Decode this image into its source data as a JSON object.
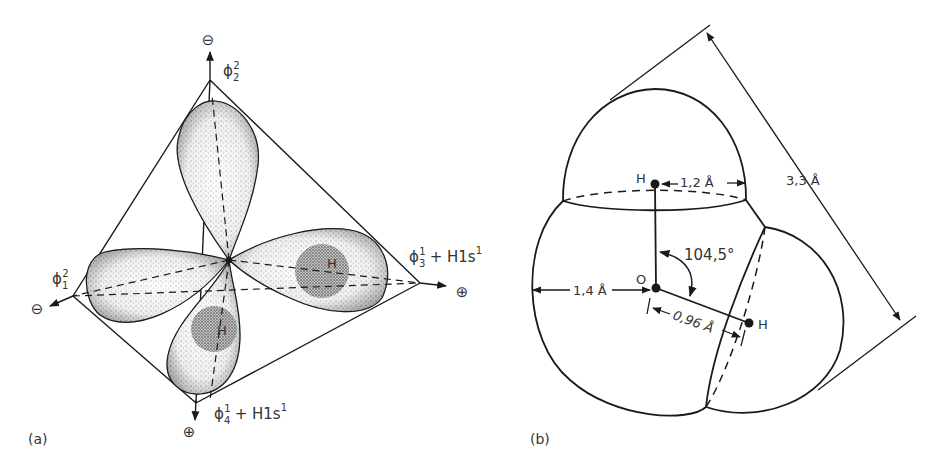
{
  "panel_a": {
    "label": "(a)",
    "axes": {
      "top": {
        "orbital": "ϕ",
        "sub": "2",
        "sup": "2",
        "sign": "⊖",
        "extra": ""
      },
      "left": {
        "orbital": "ϕ",
        "sub": "1",
        "sup": "2",
        "sign": "⊖",
        "extra": ""
      },
      "right": {
        "orbital": "ϕ",
        "sub": "3",
        "sup": "1",
        "sign": "⊕",
        "extra": "+ H1s",
        "extra_sup": "1"
      },
      "bottom": {
        "orbital": "ϕ",
        "sub": "4",
        "sup": "1",
        "sign": "⊕",
        "extra": "+ H1s",
        "extra_sup": "1"
      }
    },
    "hydrogen_labels": [
      "H",
      "H"
    ]
  },
  "panel_b": {
    "label": "(b)",
    "atoms": {
      "oxygen": "O",
      "hydrogen_top": "H",
      "hydrogen_right": "H"
    },
    "dimensions": {
      "h_radius": "1,2 Å",
      "o_radius": "1,4 Å",
      "bond_length": "0,96 Å",
      "overall_width": "3,3 Å",
      "bond_angle": "104,5°"
    }
  },
  "colors": {
    "ink": "#1a1a1a",
    "text": "#333333",
    "stipple": "#2a2a2a",
    "background": "#ffffff"
  }
}
